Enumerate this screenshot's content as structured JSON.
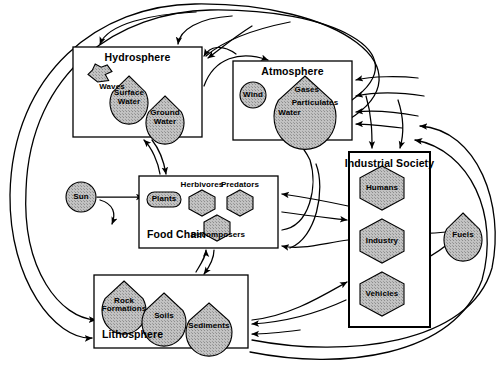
{
  "diagram": {
    "type": "systems-flow-diagram",
    "colors": {
      "stroke": "#000000",
      "background": "#ffffff",
      "node_fill": "#bfbfbf",
      "box_fill": "#ffffff"
    },
    "containers": [
      {
        "id": "hydrosphere",
        "label": "Hydrosphere",
        "title_align": "center",
        "x": 73,
        "y": 47,
        "w": 129,
        "h": 90,
        "nodes": [
          {
            "id": "waves",
            "label": "Waves",
            "shape": "wave",
            "x": 88,
            "y": 64,
            "w": 24,
            "h": 18,
            "label_pos": "below-right"
          },
          {
            "id": "surface-water",
            "label": "Surface Water",
            "shape": "shell",
            "x": 110,
            "y": 76,
            "w": 38,
            "h": 38,
            "label_pos": "inside"
          },
          {
            "id": "ground-water",
            "label": "Ground Water",
            "shape": "shell",
            "x": 146,
            "y": 96,
            "w": 38,
            "h": 38,
            "label_pos": "inside"
          }
        ]
      },
      {
        "id": "atmosphere",
        "label": "Atmosphere",
        "title_align": "center",
        "x": 233,
        "y": 61,
        "w": 119,
        "h": 79,
        "nodes": [
          {
            "id": "wind",
            "label": "Wind",
            "shape": "circle",
            "x": 240,
            "y": 82,
            "w": 26,
            "h": 26,
            "label_pos": "inside"
          },
          {
            "id": "atmos-content",
            "label": "Gases",
            "shape": "shell",
            "x": 274,
            "y": 76,
            "w": 62,
            "h": 58,
            "label_pos": "inside",
            "sub_labels": [
              "Gases",
              "Particulates",
              "Water"
            ]
          }
        ]
      },
      {
        "id": "food-chain",
        "label": "Food Chain",
        "title_align": "left",
        "x": 139,
        "y": 176,
        "w": 139,
        "h": 72,
        "nodes": [
          {
            "id": "plants",
            "label": "Plants",
            "shape": "roundrect",
            "x": 147,
            "y": 192,
            "w": 34,
            "h": 15,
            "label_pos": "inside"
          },
          {
            "id": "herbivores",
            "label": "Herbivores",
            "shape": "hex",
            "x": 189,
            "y": 190,
            "w": 26,
            "h": 26,
            "label_pos": "above"
          },
          {
            "id": "predators",
            "label": "Predators",
            "shape": "hex",
            "x": 227,
            "y": 190,
            "w": 26,
            "h": 26,
            "label_pos": "above"
          },
          {
            "id": "decomposers",
            "label": "Decomposers",
            "shape": "hex",
            "x": 204,
            "y": 215,
            "w": 26,
            "h": 26,
            "label_pos": "center"
          }
        ]
      },
      {
        "id": "industrial-society",
        "label": "Industrial Society",
        "title_align": "left",
        "x": 349,
        "y": 152,
        "w": 81,
        "h": 175,
        "nodes": [
          {
            "id": "humans",
            "label": "Humans",
            "shape": "hex",
            "x": 360,
            "y": 166,
            "w": 44,
            "h": 44,
            "label_pos": "inside"
          },
          {
            "id": "industry",
            "label": "Industry",
            "shape": "hex",
            "x": 360,
            "y": 219,
            "w": 44,
            "h": 44,
            "label_pos": "inside"
          },
          {
            "id": "vehicles",
            "label": "Vehicles",
            "shape": "hex",
            "x": 360,
            "y": 272,
            "w": 44,
            "h": 44,
            "label_pos": "inside"
          }
        ]
      },
      {
        "id": "lithosphere",
        "label": "Lithosphere",
        "title_align": "left",
        "x": 94,
        "y": 275,
        "w": 154,
        "h": 73,
        "nodes": [
          {
            "id": "rock-formations",
            "label": "Rock Formations",
            "shape": "shell",
            "x": 102,
            "y": 281,
            "w": 44,
            "h": 42,
            "label_pos": "inside"
          },
          {
            "id": "soils",
            "label": "Soils",
            "shape": "shell",
            "x": 142,
            "y": 293,
            "w": 44,
            "h": 42,
            "label_pos": "inside"
          },
          {
            "id": "sediments",
            "label": "Sediments",
            "shape": "shell",
            "x": 186,
            "y": 303,
            "w": 46,
            "h": 42,
            "label_pos": "inside"
          }
        ]
      }
    ],
    "free_nodes": [
      {
        "id": "sun",
        "label": "Sun",
        "shape": "circle",
        "x": 66,
        "y": 182,
        "w": 30,
        "h": 30
      },
      {
        "id": "fuels",
        "label": "Fuels",
        "shape": "shell",
        "x": 444,
        "y": 213,
        "w": 38,
        "h": 38
      }
    ],
    "flows": [
      {
        "from": "sun",
        "to": "plants"
      },
      {
        "from": "sun",
        "to": "down"
      },
      {
        "from": "plants",
        "to": "herbivores"
      },
      {
        "from": "herbivores",
        "to": "predators"
      },
      {
        "from": "herbivores",
        "to": "decomposers"
      },
      {
        "from": "predators",
        "to": "decomposers"
      },
      {
        "from": "plants",
        "to": "decomposers"
      },
      {
        "from": "waves",
        "to": "surface-water"
      },
      {
        "from": "surface-water",
        "to": "ground-water"
      },
      {
        "from": "ground-water",
        "to": "surface-water"
      },
      {
        "from": "rock-formations",
        "to": "soils"
      },
      {
        "from": "soils",
        "to": "sediments"
      },
      {
        "from": "fuels",
        "to": "industry"
      },
      {
        "from": "fuels",
        "to": "vehicles"
      },
      {
        "from": "industrial-society",
        "to": "atmosphere"
      },
      {
        "from": "industrial-society",
        "to": "hydrosphere"
      },
      {
        "from": "industrial-society",
        "to": "food-chain"
      },
      {
        "from": "industrial-society",
        "to": "lithosphere"
      },
      {
        "from": "food-chain",
        "to": "atmosphere"
      },
      {
        "from": "food-chain",
        "to": "lithosphere"
      },
      {
        "from": "lithosphere",
        "to": "food-chain"
      },
      {
        "from": "hydrosphere",
        "to": "atmosphere"
      },
      {
        "from": "atmosphere",
        "to": "hydrosphere"
      },
      {
        "from": "hydrosphere",
        "to": "food-chain"
      },
      {
        "from": "lithosphere",
        "to": "hydrosphere"
      }
    ]
  }
}
